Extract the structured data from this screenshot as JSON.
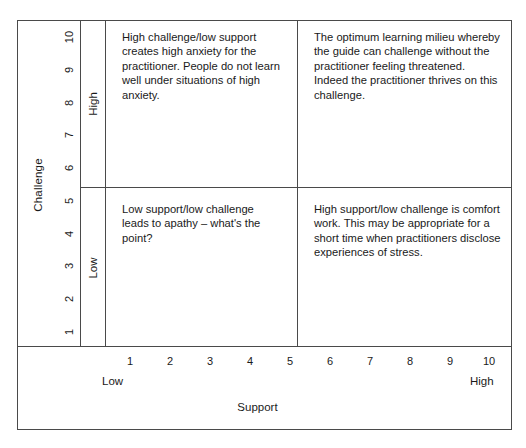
{
  "diagram": {
    "title_y_axis": "Challenge",
    "title_x_axis": "Support",
    "colors": {
      "line": "#4a4a4a",
      "text": "#1a1a1a",
      "background": "#ffffff"
    }
  },
  "y_axis": {
    "label": "Challenge",
    "ticks": [
      "10",
      "9",
      "8",
      "7",
      "6",
      "5",
      "4",
      "3",
      "2",
      "1"
    ],
    "bands": [
      {
        "name": "high",
        "label": "High"
      },
      {
        "name": "low",
        "label": "Low"
      }
    ]
  },
  "x_axis": {
    "label": "Support",
    "ticks": [
      "1",
      "2",
      "3",
      "4",
      "5",
      "6",
      "7",
      "8",
      "9",
      "10"
    ],
    "low_label": "Low",
    "high_label": "High"
  },
  "quadrants": {
    "top_left": {
      "name": "high-challenge-low-support",
      "text": "High challenge/low support creates high anxiety for the practitioner. People do not learn well under situations of high anxiety."
    },
    "top_right": {
      "name": "high-challenge-high-support",
      "text": "The optimum learning milieu whereby the guide can challenge without the practitioner feeling threatened. Indeed the practitioner thrives on this challenge."
    },
    "bottom_left": {
      "name": "low-challenge-low-support",
      "text": "Low support/low challenge leads to apathy – what's the point?"
    },
    "bottom_right": {
      "name": "low-challenge-high-support",
      "text": "High support/low challenge is comfort work. This may be appropriate for a short time when practitioners disclose experiences of stress."
    }
  }
}
